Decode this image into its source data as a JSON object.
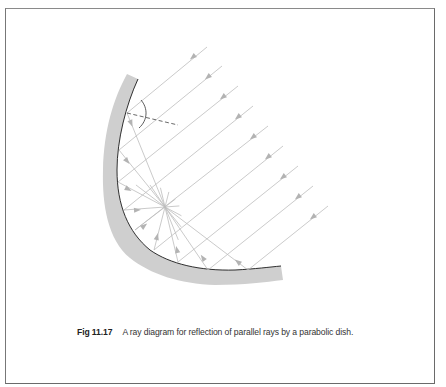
{
  "figure": {
    "number": "Fig 11.17",
    "caption": "A ray diagram for reflection of parallel rays by a parabolic dish."
  },
  "diagram": {
    "type": "ray-diagram",
    "colors": {
      "dish_fill": "#cfcfcf",
      "dish_edge": "#1a1a1a",
      "ray": "#bdbdbd",
      "arrow": "#b3b3b3",
      "normal_dashed": "#444444",
      "frame": "#6a6a6a"
    },
    "focus": [
      165,
      207
    ],
    "incident_ray_count": 9,
    "rays": [
      {
        "start": [
          207,
          47
        ],
        "hit": [
          127,
          113
        ],
        "in_arrow": [
          193,
          57
        ],
        "out_arrow": [
          131,
          123
        ]
      },
      {
        "start": [
          222,
          66
        ],
        "hit": [
          119,
          150
        ],
        "in_arrow": [
          208,
          77
        ],
        "out_arrow": [
          127,
          161
        ]
      },
      {
        "start": [
          238,
          86
        ],
        "hit": [
          118,
          182
        ],
        "in_arrow": [
          223,
          97
        ],
        "out_arrow": [
          128,
          189
        ]
      },
      {
        "start": [
          253,
          106
        ],
        "hit": [
          124,
          210
        ],
        "in_arrow": [
          238,
          117
        ],
        "out_arrow": [
          137,
          210
        ]
      },
      {
        "start": [
          268,
          126
        ],
        "hit": [
          135,
          230
        ],
        "in_arrow": [
          253,
          137
        ],
        "out_arrow": [
          144,
          226
        ]
      },
      {
        "start": [
          283,
          146
        ],
        "hit": [
          154,
          250
        ],
        "in_arrow": [
          268,
          157
        ],
        "out_arrow": [
          157,
          237
        ]
      },
      {
        "start": [
          298,
          166
        ],
        "hit": [
          178,
          262
        ],
        "in_arrow": [
          283,
          177
        ],
        "out_arrow": [
          177,
          250
        ]
      },
      {
        "start": [
          313,
          186
        ],
        "hit": [
          208,
          270
        ],
        "in_arrow": [
          298,
          197
        ],
        "out_arrow": [
          203,
          258
        ]
      },
      {
        "start": [
          328,
          206
        ],
        "hit": [
          248,
          270
        ],
        "in_arrow": [
          313,
          217
        ],
        "out_arrow": [
          238,
          262
        ]
      }
    ],
    "normal_line": {
      "from": [
        127,
        113
      ],
      "to": [
        178,
        125
      ]
    }
  }
}
